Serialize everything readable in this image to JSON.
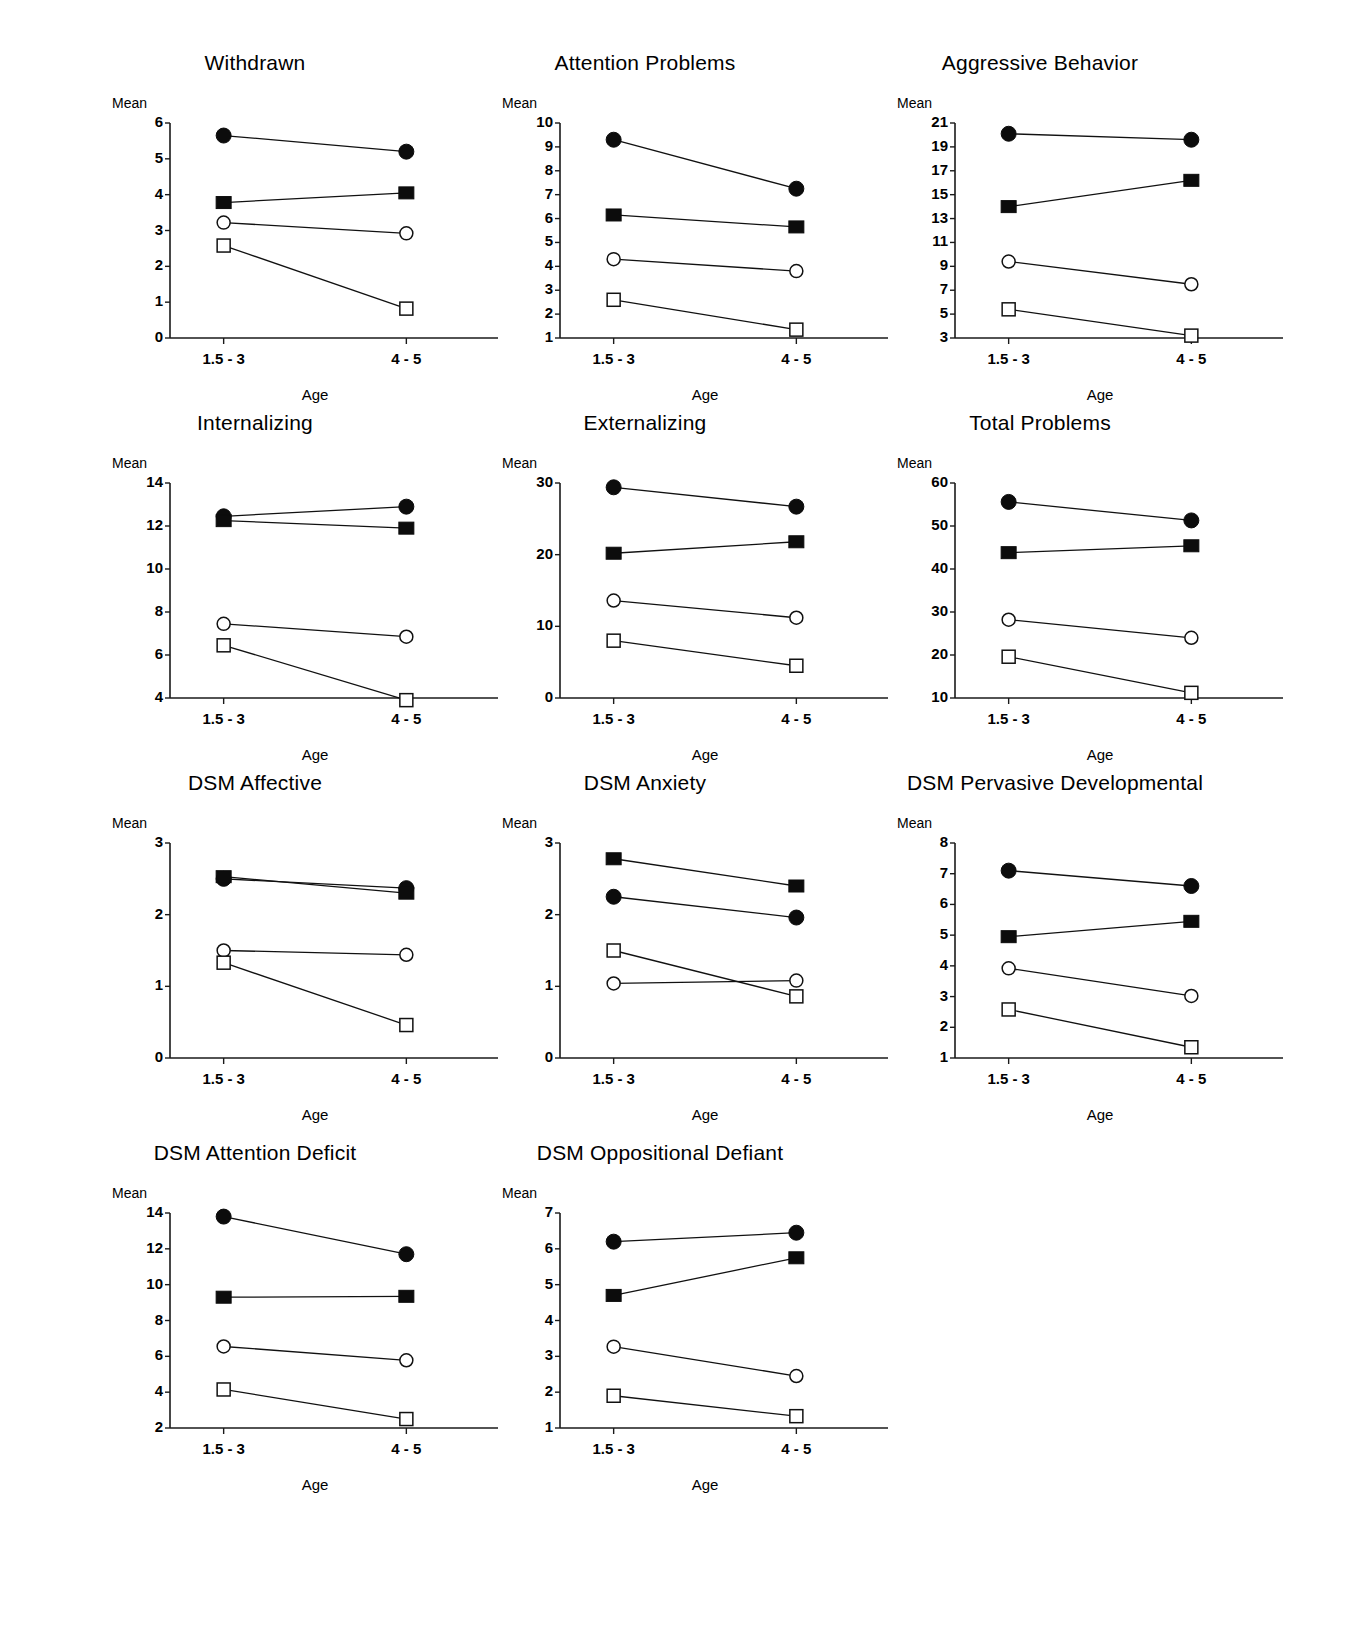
{
  "figure": {
    "axis_x_title": "Age",
    "axis_y_title": "Mean",
    "x_categories": [
      "1.5  -  3",
      "4  -  5"
    ],
    "marker_series": [
      "filled-circle",
      "filled-square",
      "open-circle",
      "open-square"
    ]
  },
  "chart_data": [
    {
      "type": "line",
      "title": "Withdrawn",
      "xlabel": "Age",
      "ylabel": "Mean",
      "x": [
        "1.5  -  3",
        "4  -  5"
      ],
      "ylim": [
        0,
        6
      ],
      "yticks": [
        0,
        1,
        2,
        3,
        4,
        5,
        6
      ],
      "grid": false,
      "series": [
        {
          "name": "filled-circle",
          "values": [
            5.65,
            5.2
          ]
        },
        {
          "name": "filled-square",
          "values": [
            3.78,
            4.05
          ]
        },
        {
          "name": "open-circle",
          "values": [
            3.22,
            2.92
          ]
        },
        {
          "name": "open-square",
          "values": [
            2.58,
            0.82
          ]
        }
      ]
    },
    {
      "type": "line",
      "title": "Attention Problems",
      "xlabel": "Age",
      "ylabel": "Mean",
      "x": [
        "1.5  -  3",
        "4  -  5"
      ],
      "ylim": [
        1,
        10
      ],
      "yticks": [
        1,
        2,
        3,
        4,
        5,
        6,
        7,
        8,
        9,
        10
      ],
      "grid": false,
      "series": [
        {
          "name": "filled-circle",
          "values": [
            9.3,
            7.25
          ]
        },
        {
          "name": "filled-square",
          "values": [
            6.15,
            5.65
          ]
        },
        {
          "name": "open-circle",
          "values": [
            4.3,
            3.8
          ]
        },
        {
          "name": "open-square",
          "values": [
            2.6,
            1.35
          ]
        }
      ]
    },
    {
      "type": "line",
      "title": "Aggressive Behavior",
      "xlabel": "Age",
      "ylabel": "Mean",
      "x": [
        "1.5  -  3",
        "4  -  5"
      ],
      "ylim": [
        3,
        21
      ],
      "yticks": [
        3,
        5,
        7,
        9,
        11,
        13,
        15,
        17,
        19,
        21
      ],
      "grid": false,
      "series": [
        {
          "name": "filled-circle",
          "values": [
            20.1,
            19.6
          ]
        },
        {
          "name": "filled-square",
          "values": [
            14.0,
            16.2
          ]
        },
        {
          "name": "open-circle",
          "values": [
            9.4,
            7.5
          ]
        },
        {
          "name": "open-square",
          "values": [
            5.4,
            3.2
          ]
        }
      ]
    },
    {
      "type": "line",
      "title": "Internalizing",
      "xlabel": "Age",
      "ylabel": "Mean",
      "x": [
        "1.5  -  3",
        "4  -  5"
      ],
      "ylim": [
        4,
        14
      ],
      "yticks": [
        4,
        6,
        8,
        10,
        12,
        14
      ],
      "grid": false,
      "series": [
        {
          "name": "filled-circle",
          "values": [
            12.45,
            12.9
          ]
        },
        {
          "name": "filled-square",
          "values": [
            12.25,
            11.9
          ]
        },
        {
          "name": "open-circle",
          "values": [
            7.45,
            6.85
          ]
        },
        {
          "name": "open-square",
          "values": [
            6.45,
            3.9
          ]
        }
      ]
    },
    {
      "type": "line",
      "title": "Externalizing",
      "xlabel": "Age",
      "ylabel": "Mean",
      "x": [
        "1.5  -  3",
        "4  -  5"
      ],
      "ylim": [
        0,
        30
      ],
      "yticks": [
        0,
        10,
        20,
        30
      ],
      "grid": false,
      "series": [
        {
          "name": "filled-circle",
          "values": [
            29.4,
            26.7
          ]
        },
        {
          "name": "filled-square",
          "values": [
            20.2,
            21.8
          ]
        },
        {
          "name": "open-circle",
          "values": [
            13.6,
            11.2
          ]
        },
        {
          "name": "open-square",
          "values": [
            8.0,
            4.5
          ]
        }
      ]
    },
    {
      "type": "line",
      "title": "Total Problems",
      "xlabel": "Age",
      "ylabel": "Mean",
      "x": [
        "1.5  -  3",
        "4  -  5"
      ],
      "ylim": [
        10,
        60
      ],
      "yticks": [
        10,
        20,
        30,
        40,
        50,
        60
      ],
      "grid": false,
      "series": [
        {
          "name": "filled-circle",
          "values": [
            55.6,
            51.3
          ]
        },
        {
          "name": "filled-square",
          "values": [
            43.8,
            45.4
          ]
        },
        {
          "name": "open-circle",
          "values": [
            28.2,
            24.0
          ]
        },
        {
          "name": "open-square",
          "values": [
            19.6,
            11.2
          ]
        }
      ]
    },
    {
      "type": "line",
      "title": "DSM Affective",
      "xlabel": "Age",
      "ylabel": "Mean",
      "x": [
        "1.5  -  3",
        "4  -  5"
      ],
      "ylim": [
        0,
        3
      ],
      "yticks": [
        0,
        1,
        2,
        3
      ],
      "grid": false,
      "series": [
        {
          "name": "filled-circle",
          "values": [
            2.5,
            2.37
          ]
        },
        {
          "name": "filled-square",
          "values": [
            2.53,
            2.3
          ]
        },
        {
          "name": "open-circle",
          "values": [
            1.5,
            1.44
          ]
        },
        {
          "name": "open-square",
          "values": [
            1.33,
            0.46
          ]
        }
      ]
    },
    {
      "type": "line",
      "title": "DSM Anxiety",
      "xlabel": "Age",
      "ylabel": "Mean",
      "x": [
        "1.5  -  3",
        "4  -  5"
      ],
      "ylim": [
        0,
        3
      ],
      "yticks": [
        0,
        1,
        2,
        3
      ],
      "grid": false,
      "series": [
        {
          "name": "filled-circle",
          "values": [
            2.25,
            1.96
          ]
        },
        {
          "name": "filled-square",
          "values": [
            2.78,
            2.4
          ]
        },
        {
          "name": "open-circle",
          "values": [
            1.04,
            1.08
          ]
        },
        {
          "name": "open-square",
          "values": [
            1.5,
            0.86
          ]
        }
      ]
    },
    {
      "type": "line",
      "title": "DSM Pervasive Developmental",
      "xlabel": "Age",
      "ylabel": "Mean",
      "x": [
        "1.5  -  3",
        "4  -  5"
      ],
      "ylim": [
        1,
        8
      ],
      "yticks": [
        1,
        2,
        3,
        4,
        5,
        6,
        7,
        8
      ],
      "grid": false,
      "series": [
        {
          "name": "filled-circle",
          "values": [
            7.1,
            6.6
          ]
        },
        {
          "name": "filled-square",
          "values": [
            4.95,
            5.45
          ]
        },
        {
          "name": "open-circle",
          "values": [
            3.92,
            3.02
          ]
        },
        {
          "name": "open-square",
          "values": [
            2.58,
            1.35
          ]
        }
      ]
    },
    {
      "type": "line",
      "title": "DSM Attention Deficit",
      "xlabel": "Age",
      "ylabel": "Mean",
      "x": [
        "1.5  -  3",
        "4  -  5"
      ],
      "ylim": [
        2,
        14
      ],
      "yticks": [
        2,
        4,
        6,
        8,
        10,
        12,
        14
      ],
      "grid": false,
      "series": [
        {
          "name": "filled-circle",
          "values": [
            13.8,
            11.7
          ]
        },
        {
          "name": "filled-square",
          "values": [
            9.3,
            9.35
          ]
        },
        {
          "name": "open-circle",
          "values": [
            6.55,
            5.78
          ]
        },
        {
          "name": "open-square",
          "values": [
            4.15,
            2.5
          ]
        }
      ]
    },
    {
      "type": "line",
      "title": "DSM Oppositional Defiant",
      "xlabel": "Age",
      "ylabel": "Mean",
      "x": [
        "1.5  -  3",
        "4  -  5"
      ],
      "ylim": [
        1,
        7
      ],
      "yticks": [
        1,
        2,
        3,
        4,
        5,
        6,
        7
      ],
      "grid": false,
      "series": [
        {
          "name": "filled-circle",
          "values": [
            6.2,
            6.45
          ]
        },
        {
          "name": "filled-square",
          "values": [
            4.7,
            5.75
          ]
        },
        {
          "name": "open-circle",
          "values": [
            3.27,
            2.45
          ]
        },
        {
          "name": "open-square",
          "values": [
            1.9,
            1.33
          ]
        }
      ]
    }
  ]
}
